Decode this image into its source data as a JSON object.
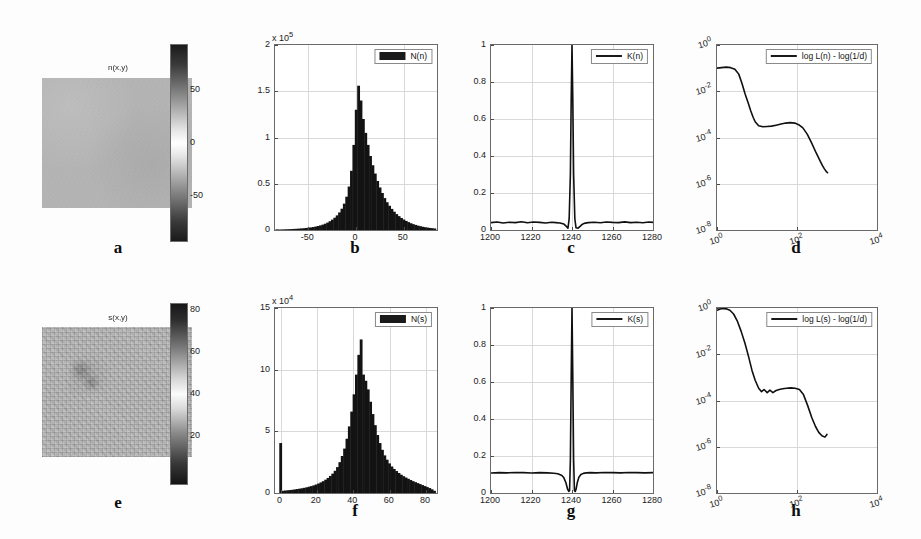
{
  "figure": {
    "panel_letters": [
      "a",
      "b",
      "c",
      "d",
      "e",
      "f",
      "g",
      "h"
    ],
    "background_color": "#fdfdfd",
    "line_color": "#101010",
    "bar_color": "#131313"
  },
  "panels": {
    "a": {
      "letter": "a",
      "title": "n(x,y)",
      "type": "image",
      "colorbar": {
        "ticks": [
          "50",
          "0",
          "-50"
        ],
        "min": -85,
        "max": 85
      },
      "field_mean_gray": "#b4b4b4",
      "texture": "smooth"
    },
    "e": {
      "letter": "e",
      "title": "s(x,y)",
      "type": "image",
      "colorbar": {
        "ticks": [
          "80",
          "60",
          "40",
          "20"
        ],
        "min": 5,
        "max": 90
      },
      "field_mean_gray": "#b7b7b7",
      "texture": "speckled"
    },
    "b": {
      "letter": "b",
      "legend_label": "N(n)",
      "legend_style": "bar"
    },
    "f": {
      "letter": "f",
      "legend_label": "N(s)",
      "legend_style": "bar"
    },
    "c": {
      "letter": "c",
      "legend_label": "K(n)",
      "legend_style": "line"
    },
    "g": {
      "letter": "g",
      "legend_label": "K(s)",
      "legend_style": "line"
    },
    "d": {
      "letter": "d",
      "legend_label": "log L(n) - log(1/d)",
      "legend_style": "line"
    },
    "h": {
      "letter": "h",
      "legend_label": "log L(s) - log(1/d)",
      "legend_style": "line"
    }
  },
  "chart_data": [
    {
      "id": "b",
      "type": "bar",
      "title": "",
      "xlabel": "",
      "ylabel": "",
      "y_exponent_label": "x 10",
      "y_exponent_sup": "5",
      "xlim": [
        -85,
        85
      ],
      "ylim": [
        0,
        2
      ],
      "xticks": [
        -50,
        0,
        50
      ],
      "xticklabels": [
        "-50",
        "0",
        "50"
      ],
      "yticks": [
        0,
        0.5,
        1,
        1.5,
        2
      ],
      "yticklabels": [
        "0",
        "0.5",
        "1",
        "1.5",
        "2"
      ],
      "grid": true,
      "legend": "N(n)",
      "legend_position": "top-right",
      "bin_width": 2.5,
      "x": [
        -85,
        -82.5,
        -80,
        -77.5,
        -75,
        -72.5,
        -70,
        -67.5,
        -65,
        -62.5,
        -60,
        -57.5,
        -55,
        -52.5,
        -50,
        -47.5,
        -45,
        -42.5,
        -40,
        -37.5,
        -35,
        -32.5,
        -30,
        -27.5,
        -25,
        -22.5,
        -20,
        -17.5,
        -15,
        -12.5,
        -10,
        -7.5,
        -5,
        -2.5,
        0,
        2.5,
        5,
        7.5,
        10,
        12.5,
        15,
        17.5,
        20,
        22.5,
        25,
        27.5,
        30,
        32.5,
        35,
        37.5,
        40,
        42.5,
        45,
        47.5,
        50,
        52.5,
        55,
        57.5,
        60,
        62.5,
        65,
        67.5,
        70,
        72.5,
        75,
        77.5,
        80,
        82.5
      ],
      "values": [
        0.004,
        0.005,
        0.005,
        0.006,
        0.007,
        0.008,
        0.009,
        0.01,
        0.012,
        0.013,
        0.015,
        0.017,
        0.019,
        0.022,
        0.025,
        0.028,
        0.032,
        0.037,
        0.043,
        0.05,
        0.058,
        0.068,
        0.08,
        0.095,
        0.112,
        0.133,
        0.158,
        0.19,
        0.23,
        0.285,
        0.36,
        0.47,
        0.64,
        0.92,
        1.3,
        1.56,
        1.4,
        1.2,
        1.05,
        0.92,
        0.8,
        0.7,
        0.61,
        0.53,
        0.46,
        0.4,
        0.345,
        0.3,
        0.262,
        0.228,
        0.198,
        0.172,
        0.15,
        0.13,
        0.113,
        0.098,
        0.085,
        0.073,
        0.063,
        0.055,
        0.047,
        0.041,
        0.035,
        0.03,
        0.026,
        0.022,
        0.019,
        0.016
      ],
      "peak_value": 1.56,
      "peak_x": 2.5
    },
    {
      "id": "f",
      "type": "bar",
      "title": "",
      "xlabel": "",
      "ylabel": "",
      "y_exponent_label": "x 10",
      "y_exponent_sup": "4",
      "xlim": [
        -3,
        86
      ],
      "ylim": [
        0,
        15
      ],
      "xticks": [
        0,
        20,
        40,
        60,
        80
      ],
      "xticklabels": [
        "0",
        "20",
        "40",
        "60",
        "80"
      ],
      "yticks": [
        0,
        5,
        10,
        15
      ],
      "yticklabels": [
        "0",
        "5",
        "10",
        "15"
      ],
      "grid": true,
      "legend": "N(s)",
      "legend_position": "top-right",
      "bin_width": 1.3,
      "x": [
        0,
        1.3,
        2.6,
        3.9,
        5.2,
        6.5,
        7.8,
        9.1,
        10.4,
        11.7,
        13,
        14.3,
        15.6,
        16.9,
        18.2,
        19.5,
        20.8,
        22.1,
        23.4,
        24.7,
        26,
        27.3,
        28.6,
        29.9,
        31.2,
        32.5,
        33.8,
        35.1,
        36.4,
        37.7,
        39,
        40.3,
        41.6,
        42.9,
        44.2,
        45.5,
        46.8,
        48.1,
        49.4,
        50.7,
        52,
        53.3,
        54.6,
        55.9,
        57.2,
        58.5,
        59.8,
        61.1,
        62.4,
        63.7,
        65,
        66.3,
        67.6,
        68.9,
        70.2,
        71.5,
        72.8,
        74.1,
        75.4,
        76.7,
        78,
        79.3,
        80.6,
        81.9,
        83.2,
        84.5
      ],
      "values": [
        4.05,
        0.18,
        0.2,
        0.22,
        0.24,
        0.26,
        0.29,
        0.32,
        0.35,
        0.38,
        0.42,
        0.46,
        0.51,
        0.56,
        0.62,
        0.69,
        0.77,
        0.86,
        0.96,
        1.08,
        1.22,
        1.38,
        1.57,
        1.8,
        2.1,
        2.5,
        3.0,
        3.6,
        4.4,
        5.4,
        6.6,
        8.0,
        9.6,
        11.2,
        12.45,
        9.6,
        9.1,
        8.4,
        7.4,
        6.4,
        5.5,
        4.7,
        4.05,
        3.5,
        3.05,
        2.7,
        2.4,
        2.15,
        1.95,
        1.78,
        1.62,
        1.48,
        1.36,
        1.25,
        1.15,
        1.05,
        0.96,
        0.88,
        0.8,
        0.72,
        0.64,
        0.56,
        0.48,
        0.4,
        0.3,
        0.18
      ],
      "peak_value": 12.45,
      "peak_x": 44.2,
      "zero_spike_value": 4.05
    },
    {
      "id": "c",
      "type": "line",
      "title": "",
      "xlabel": "",
      "ylabel": "",
      "xlim": [
        1200,
        1280
      ],
      "ylim": [
        0,
        1
      ],
      "xticks": [
        1200,
        1220,
        1240,
        1260,
        1280
      ],
      "xticklabels": [
        "1200",
        "1220",
        "1240",
        "1260",
        "1280"
      ],
      "yticks": [
        0,
        0.2,
        0.4,
        0.6,
        0.8,
        1
      ],
      "yticklabels": [
        "0",
        "0.2",
        "0.4",
        "0.6",
        "0.8",
        "1"
      ],
      "grid": true,
      "legend": "K(n)",
      "legend_position": "top-right",
      "baseline": 0.04,
      "peak_x": 1240,
      "peak_value": 1.0,
      "dip_value": 0.005,
      "x": [
        1200,
        1203,
        1206,
        1209,
        1212,
        1215,
        1218,
        1221,
        1224,
        1227,
        1230,
        1232,
        1234,
        1236,
        1237,
        1238,
        1238.6,
        1239.2,
        1239.6,
        1240,
        1240.4,
        1240.8,
        1241.4,
        1242,
        1243,
        1244,
        1245,
        1246,
        1248,
        1251,
        1254,
        1257,
        1260,
        1263,
        1266,
        1269,
        1272,
        1275,
        1278,
        1280
      ],
      "y": [
        0.04,
        0.043,
        0.038,
        0.042,
        0.04,
        0.045,
        0.039,
        0.043,
        0.041,
        0.038,
        0.042,
        0.04,
        0.038,
        0.032,
        0.022,
        0.01,
        0.06,
        0.3,
        0.7,
        1.0,
        0.7,
        0.3,
        0.06,
        0.012,
        0.01,
        0.02,
        0.03,
        0.036,
        0.04,
        0.042,
        0.039,
        0.043,
        0.041,
        0.04,
        0.044,
        0.04,
        0.042,
        0.039,
        0.043,
        0.041
      ]
    },
    {
      "id": "g",
      "type": "line",
      "title": "",
      "xlabel": "",
      "ylabel": "",
      "xlim": [
        1200,
        1280
      ],
      "ylim": [
        0,
        1
      ],
      "xticks": [
        1200,
        1220,
        1240,
        1260,
        1280
      ],
      "xticklabels": [
        "1200",
        "1220",
        "1240",
        "1260",
        "1280"
      ],
      "yticks": [
        0,
        0.2,
        0.4,
        0.6,
        0.8,
        1
      ],
      "yticklabels": [
        "0",
        "0.2",
        "0.4",
        "0.6",
        "0.8",
        "1"
      ],
      "grid": true,
      "legend": "K(s)",
      "legend_position": "top-right",
      "baseline": 0.11,
      "peak_x": 1240,
      "peak_value": 1.0,
      "dip_value": 0.01,
      "x": [
        1200,
        1204,
        1208,
        1212,
        1216,
        1220,
        1224,
        1228,
        1231,
        1233,
        1235,
        1236,
        1237,
        1237.8,
        1238.4,
        1238.8,
        1239.2,
        1239.6,
        1240,
        1240.4,
        1240.8,
        1241.2,
        1241.6,
        1242,
        1242.6,
        1243.4,
        1244.4,
        1245.6,
        1247,
        1249,
        1252,
        1256,
        1260,
        1264,
        1268,
        1272,
        1276,
        1280
      ],
      "y": [
        0.108,
        0.11,
        0.109,
        0.111,
        0.11,
        0.108,
        0.11,
        0.109,
        0.107,
        0.104,
        0.095,
        0.082,
        0.055,
        0.022,
        0.008,
        0.012,
        0.18,
        0.62,
        1.0,
        0.62,
        0.18,
        0.015,
        0.008,
        0.02,
        0.055,
        0.085,
        0.1,
        0.106,
        0.109,
        0.11,
        0.109,
        0.111,
        0.11,
        0.109,
        0.111,
        0.11,
        0.109,
        0.11
      ]
    },
    {
      "id": "d",
      "type": "line",
      "title": "",
      "xlabel": "",
      "ylabel": "",
      "xscale": "log",
      "yscale": "log",
      "xlim": [
        1,
        10000
      ],
      "ylim": [
        1e-08,
        1
      ],
      "xticks": [
        1,
        100,
        10000
      ],
      "xticklabels": [
        "10",
        "10",
        "10"
      ],
      "xtick_exponents": [
        "0",
        "2",
        "4"
      ],
      "yticks": [
        1,
        0.01,
        0.0001,
        1e-06,
        1e-08
      ],
      "yticklabels": [
        "10",
        "10",
        "10",
        "10",
        "10"
      ],
      "ytick_exponents": [
        "0",
        "-2",
        "-4",
        "-6",
        "-8"
      ],
      "grid": true,
      "legend": "log L(n) - log(1/d)",
      "legend_position": "top-right",
      "x": [
        1,
        1.3,
        1.7,
        2.2,
        2.8,
        3.5,
        4.2,
        5,
        6,
        7,
        8,
        9,
        11,
        14,
        18,
        23,
        30,
        40,
        52,
        68,
        88,
        110,
        140,
        180,
        230,
        300,
        380,
        430,
        480,
        530,
        580
      ],
      "y": [
        0.1,
        0.105,
        0.11,
        0.105,
        0.09,
        0.055,
        0.022,
        0.008,
        0.0032,
        0.0014,
        0.00075,
        0.00048,
        0.00032,
        0.00029,
        0.0003,
        0.00031,
        0.00034,
        0.00038,
        0.00042,
        0.00044,
        0.00042,
        0.00036,
        0.00026,
        0.00014,
        6e-05,
        2.2e-05,
        9.5e-06,
        6.2e-06,
        4.5e-06,
        3.5e-06,
        3e-06
      ]
    },
    {
      "id": "h",
      "type": "line",
      "title": "",
      "xlabel": "",
      "ylabel": "",
      "xscale": "log",
      "yscale": "log",
      "xlim": [
        1,
        10000
      ],
      "ylim": [
        1e-08,
        1
      ],
      "xticks": [
        1,
        100,
        10000
      ],
      "xticklabels": [
        "10",
        "10",
        "10"
      ],
      "xtick_exponents": [
        "0",
        "2",
        "4"
      ],
      "yticks": [
        1,
        0.01,
        0.0001,
        1e-06,
        1e-08
      ],
      "yticklabels": [
        "10",
        "10",
        "10",
        "10",
        "10"
      ],
      "ytick_exponents": [
        "0",
        "-2",
        "-4",
        "-6",
        "-8"
      ],
      "grid": true,
      "legend": "log L(s) - log(1/d)",
      "legend_position": "top-right",
      "x": [
        1,
        1.3,
        1.7,
        2.1,
        2.6,
        3.2,
        4,
        5,
        6.2,
        7.5,
        9,
        11,
        13,
        15,
        18,
        21,
        25,
        30,
        36,
        44,
        55,
        70,
        90,
        115,
        145,
        185,
        235,
        290,
        350,
        420,
        500,
        560
      ],
      "y": [
        0.8,
        0.95,
        0.92,
        0.8,
        0.55,
        0.28,
        0.1,
        0.03,
        0.0075,
        0.002,
        0.00075,
        0.00034,
        0.00024,
        0.0003,
        0.00022,
        0.00028,
        0.00022,
        0.00027,
        0.0003,
        0.00032,
        0.00034,
        0.00035,
        0.00034,
        0.0003,
        0.00018,
        6e-05,
        1.8e-05,
        7.5e-06,
        4.2e-06,
        3e-06,
        2.6e-06,
        3.4e-06
      ]
    }
  ]
}
